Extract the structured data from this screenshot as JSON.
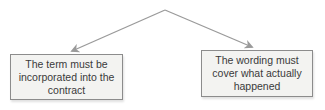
{
  "diagram": {
    "type": "tree",
    "apex": {
      "x": 165,
      "y": 10
    },
    "nodes": [
      {
        "id": "left",
        "label": "The term must be incorporated into the contract"
      },
      {
        "id": "right",
        "label": "The wording must cover what actually happened"
      }
    ],
    "edges": [
      {
        "from": "apex",
        "to": "left"
      },
      {
        "from": "apex",
        "to": "right"
      }
    ],
    "colors": {
      "box_fill": "#f3f3f1",
      "box_border": "#8c8c8c",
      "line_color": "#9a9a9a",
      "text_color": "#3a3a3a",
      "page_bg": "#ffffff"
    }
  }
}
